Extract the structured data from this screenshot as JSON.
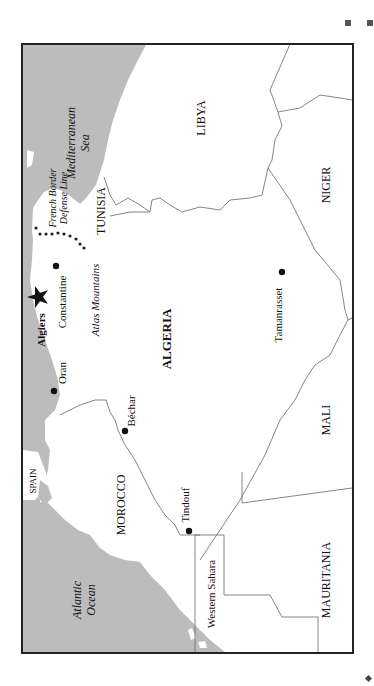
{
  "map": {
    "title": "Algeria",
    "orientation": "rotated 90 degrees clockwise (north at left)",
    "colors": {
      "water": "#bcbcbc",
      "land": "#ffffff",
      "border": "#777777",
      "frame": "#222222",
      "text": "#111111"
    },
    "countries": {
      "algeria": "ALGERIA",
      "libya": "LIBYA",
      "niger": "NIGER",
      "tunisia": "TUNISIA",
      "morocco": "MOROCCO",
      "mali": "MALI",
      "mauritania": "MAURITANIA",
      "western_sahara": "Western Sahara",
      "spain": "SPAIN"
    },
    "water_bodies": {
      "mediterranean_line1": "Mediterranean",
      "mediterranean_line2": "Sea",
      "atlantic_line1": "Atlantic",
      "atlantic_line2": "Ocean"
    },
    "cities": {
      "capital": "Algiers",
      "oran": "Oran",
      "constantine": "Constantine",
      "bechar": "Béchar",
      "tindouf": "Tindouf",
      "tamanrasset": "Tamanrasset"
    },
    "features": {
      "atlas": "Atlas Mountains",
      "defense_line1": "French Border",
      "defense_line2": "Defense Line"
    }
  }
}
